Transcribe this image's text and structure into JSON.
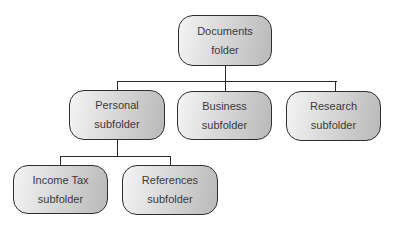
{
  "diagram": {
    "type": "folder-hierarchy",
    "root": {
      "title": "Documents",
      "subtitle": "folder"
    },
    "level1": [
      {
        "title": "Personal",
        "subtitle": "subfolder"
      },
      {
        "title": "Business",
        "subtitle": "subfolder"
      },
      {
        "title": "Research",
        "subtitle": "subfolder"
      }
    ],
    "level2": [
      {
        "title": "Income Tax",
        "subtitle": "subfolder",
        "parent": "Personal"
      },
      {
        "title": "References",
        "subtitle": "subfolder",
        "parent": "Personal"
      }
    ],
    "colors": {
      "border": "#2e2e2e",
      "fill_light": "#f4f4f4",
      "fill_dark": "#b9b9b9",
      "text": "#3a3a3a",
      "connector": "#2a2a2a"
    }
  }
}
